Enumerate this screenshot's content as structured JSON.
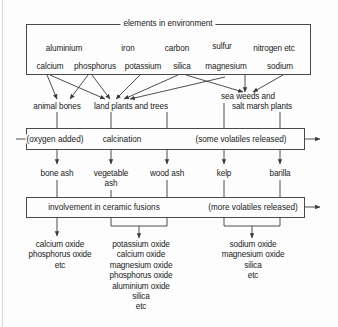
{
  "diagram": {
    "title": "elements in environment",
    "type": "flow-diagram",
    "elements_box": {
      "label": "elements in environment",
      "row1": [
        "aluminium",
        "iron",
        "carbon",
        "sulfur",
        "nitrogen etc"
      ],
      "row2": [
        "calcium",
        "phosphorus",
        "potassium",
        "silica",
        "magnesium",
        "sodium"
      ]
    },
    "sources": [
      {
        "label": "animal bones"
      },
      {
        "label": "land plants and trees"
      },
      {
        "label": "sea weeds and"
      },
      {
        "label": "salt marsh plants"
      }
    ],
    "calcination_box": {
      "input_label": "(oxygen added)",
      "process_label": "calcination",
      "output_label": "(some volatiles released)"
    },
    "ashes": [
      {
        "label": "bone ash"
      },
      {
        "label_line1": "vegetable",
        "label_line2": "ash"
      },
      {
        "label": "wood ash"
      },
      {
        "label": "kelp"
      },
      {
        "label": "barilla"
      }
    ],
    "fusion_box": {
      "process_label": "involvement in ceramic fusions",
      "output_label": "(more volatiles released)"
    },
    "products": [
      {
        "group": "bone-ash-products",
        "lines": [
          "calcium oxide",
          "phosphorus oxide",
          "etc"
        ]
      },
      {
        "group": "plant-ash-products",
        "lines": [
          "potassium oxide",
          "calcium oxide",
          "magnesium oxide",
          "phosphorus oxide",
          "aluminium oxide",
          "silica",
          "etc"
        ]
      },
      {
        "group": "marine-ash-products",
        "lines": [
          "sodium oxide",
          "magnesium oxide",
          "silica",
          "etc"
        ]
      }
    ]
  },
  "colors": {
    "line": "#4a4a4a",
    "text": "#1a1a1a",
    "background": "#fdfdfd"
  }
}
